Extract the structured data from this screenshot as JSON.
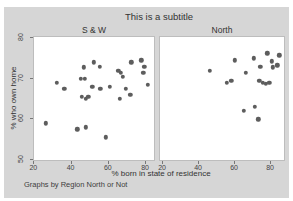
{
  "chart_data": {
    "type": "scatter",
    "title": "This is a subtitle",
    "xlabel": "% born in state of residence",
    "ylabel": "% who own home",
    "note": "Graphs by Region North or Not",
    "x_ticks": [
      20,
      40,
      60,
      80
    ],
    "y_ticks": [
      80,
      70,
      60,
      50
    ],
    "legend": "none",
    "grid": false,
    "panels": [
      {
        "label": "S & W",
        "x_range": [
          19.8,
          85.3
        ],
        "y_range": [
          49.4,
          80.3
        ],
        "points": [
          [
            26,
            59
          ],
          [
            32,
            69
          ],
          [
            36,
            67.5
          ],
          [
            43,
            57.5
          ],
          [
            45,
            70
          ],
          [
            46.5,
            72.8
          ],
          [
            47,
            70
          ],
          [
            47.5,
            58
          ],
          [
            45.5,
            65.5
          ],
          [
            47.5,
            65
          ],
          [
            49,
            65.5
          ],
          [
            51,
            68
          ],
          [
            52,
            74
          ],
          [
            55,
            73
          ],
          [
            55.5,
            67.5
          ],
          [
            58.5,
            55.5
          ],
          [
            60.5,
            68
          ],
          [
            65,
            72
          ],
          [
            66.5,
            71.5
          ],
          [
            67.5,
            70.5
          ],
          [
            66,
            65
          ],
          [
            69,
            67.5
          ],
          [
            71.5,
            66
          ],
          [
            72,
            74
          ],
          [
            77.5,
            74.5
          ],
          [
            79,
            73
          ],
          [
            78.5,
            71.5
          ],
          [
            81,
            68.5
          ]
        ]
      },
      {
        "label": "North",
        "x_range": [
          18.3,
          88.3
        ],
        "y_range": [
          49.4,
          80.3
        ],
        "points": [
          [
            46,
            72
          ],
          [
            55.5,
            69
          ],
          [
            58,
            69.5
          ],
          [
            60,
            74.5
          ],
          [
            65,
            62
          ],
          [
            66,
            71.5
          ],
          [
            70.5,
            75
          ],
          [
            71,
            63
          ],
          [
            73,
            60
          ],
          [
            73.5,
            69.5
          ],
          [
            74,
            73
          ],
          [
            75.5,
            69
          ],
          [
            77,
            68.7
          ],
          [
            78,
            76.3
          ],
          [
            79,
            69
          ],
          [
            80.5,
            74.3
          ],
          [
            81,
            72.8
          ],
          [
            83.5,
            73.3
          ],
          [
            84.5,
            75.8
          ]
        ]
      }
    ],
    "colors": {
      "figure_bg": "#d6d6d6",
      "panel_bg": "#ffffff",
      "dot": "#5d5d5d",
      "text": "#3a3a3a"
    }
  }
}
